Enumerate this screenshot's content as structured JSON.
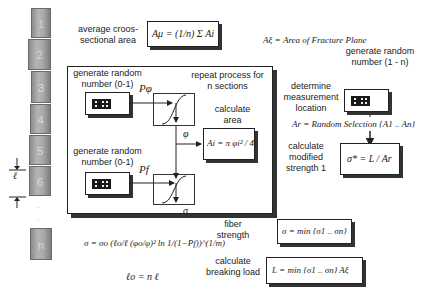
{
  "fiber": {
    "segments": [
      "1",
      "2",
      "3",
      "4",
      "5",
      "6",
      "n"
    ],
    "length_label": "ℓ",
    "dots": [
      "·",
      "·"
    ]
  },
  "labels": {
    "avg_area": "average croos-sectional area",
    "gen_random_1": "generate random number (0-1)",
    "gen_random_2": "generate random number (0-1)",
    "repeat": "repeat process for n sections",
    "calc_area": "calculate area",
    "fiber_strength": "fiber strength",
    "calc_breaking_load": "calculate breaking load",
    "gen_random_n": "generate random number (1 - n)",
    "determine_location": "determine measurement location",
    "calc_modified": "calculate modified strength 1"
  },
  "equations": {
    "avg_area": "Aμ = (1/n) Σ Ai",
    "area_fracture": "Aξ = Area of Fracture Plane",
    "area_i": "Ai = π φi² / 4",
    "sigma": "σ = σo (ℓo/ℓ (φo/φ)² ln 1/(1−Pf))^(1/m)",
    "l0": "ℓo = n ℓ",
    "sigma_min": "σ = min {σ1 .. σn}",
    "breaking_load": "L = min {σ1 .. σn} Aξ",
    "random_selection": "Ar = Random Selection {A1 .. An}",
    "modified_strength": "σ* = L / Ar"
  },
  "symbols": {
    "p_phi": "Pφ",
    "phi": "φ",
    "p_f": "Pf",
    "sigma": "σ"
  }
}
